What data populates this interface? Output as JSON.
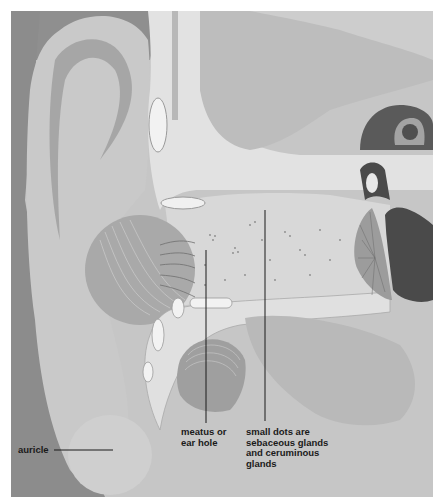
{
  "figure": {
    "colors": {
      "border": "#ffffff",
      "dark_skin": "#8f8f8f",
      "auricle_fill": "#c9c9c9",
      "cartilage_light": "#e2e2e2",
      "canal_fill": "#d6d6d6",
      "mid_gray": "#b3b3b3",
      "dark_structure": "#4a4a4a",
      "label_text": "#1a1a1a",
      "leader_line": "#1a1a1a"
    }
  },
  "labels": {
    "auricle": "auricle",
    "meatus": "meatus or\near hole",
    "small_dots": "small dots are\nsebaceous glands\nand ceruminous\nglands"
  }
}
